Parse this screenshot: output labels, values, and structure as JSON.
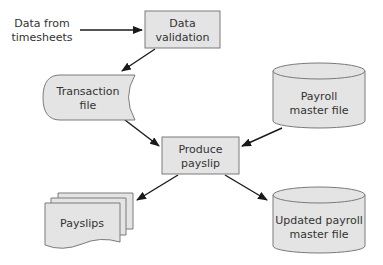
{
  "diagram": {
    "type": "system-flowchart",
    "colors": {
      "fill": "#e4e4e4",
      "stroke": "#7a7a7a",
      "arrow": "#1a1a1a",
      "text": "#333333"
    },
    "nodes": {
      "source": {
        "kind": "text",
        "line1": "Data from",
        "line2": "timesheets"
      },
      "validation": {
        "kind": "process",
        "line1": "Data",
        "line2": "validation"
      },
      "transaction": {
        "kind": "stored-data",
        "line1": "Transaction",
        "line2": "file"
      },
      "payroll_master": {
        "kind": "disk",
        "line1": "Payroll",
        "line2": "master file"
      },
      "produce": {
        "kind": "process",
        "line1": "Produce",
        "line2": "payslip"
      },
      "payslips": {
        "kind": "multi-document",
        "line1": "Payslips"
      },
      "updated_master": {
        "kind": "disk",
        "line1": "Updated payroll",
        "line2": "master file"
      }
    },
    "edges": [
      {
        "from": "source",
        "to": "validation"
      },
      {
        "from": "validation",
        "to": "transaction"
      },
      {
        "from": "transaction",
        "to": "produce"
      },
      {
        "from": "payroll_master",
        "to": "produce"
      },
      {
        "from": "produce",
        "to": "payslips"
      },
      {
        "from": "produce",
        "to": "updated_master"
      }
    ]
  }
}
